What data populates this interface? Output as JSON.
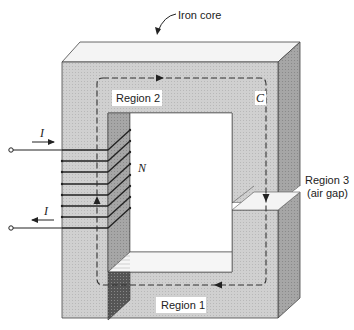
{
  "diagram": {
    "labels": {
      "iron_core": "Iron core",
      "region1": "Region 1",
      "region2": "Region 2",
      "region3_line1": "Region 3",
      "region3_line2": "(air gap)",
      "path": "C",
      "turns": "N",
      "current_in": "I",
      "current_out": "I"
    },
    "colors": {
      "core_front": "#c9c9c9",
      "core_top": "#f2f2f2",
      "core_side": "#a9a9a9",
      "inner_dark": "#8f8f8f",
      "coil": "#222222",
      "path": "#333333"
    },
    "coil_turns_drawn": 8
  }
}
